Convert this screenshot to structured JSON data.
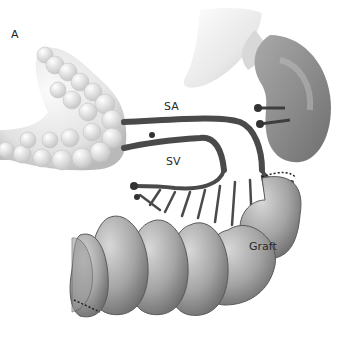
{
  "figure": {
    "panel_label": "A",
    "labels": {
      "sa": "SA",
      "sv": "SV",
      "graft": "Graft"
    }
  }
}
